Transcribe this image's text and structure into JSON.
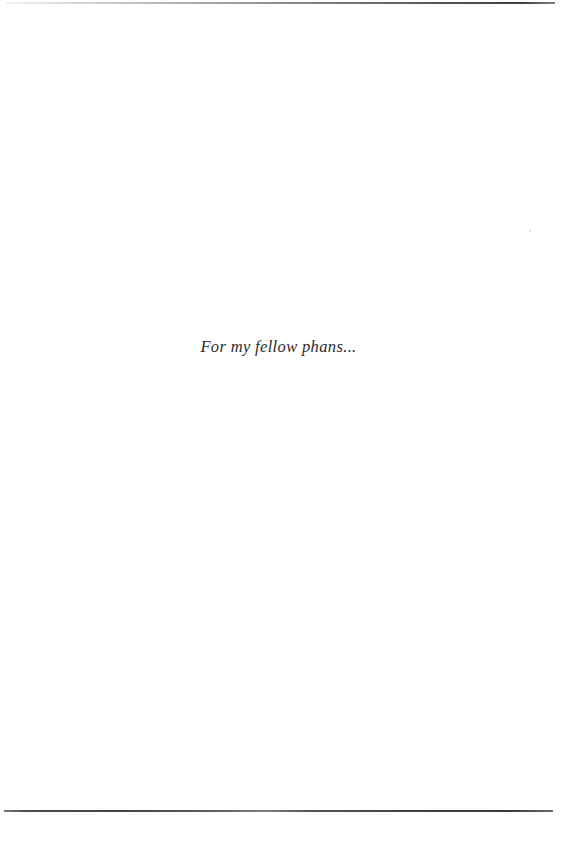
{
  "page": {
    "kind": "book-dedication-page",
    "background_color": "#ffffff",
    "width": 561,
    "height": 866
  },
  "rules": {
    "top": {
      "name": "top-horizontal-rule",
      "color": "#3e3e43",
      "fade_direction": "left"
    },
    "bottom": {
      "name": "bottom-horizontal-rule",
      "color": "#42424 7"
    }
  },
  "dedication": {
    "text": "For my fellow phans...",
    "color": "#2b2b2d",
    "style": "italic"
  },
  "artifacts": {
    "speck_label": ""
  }
}
